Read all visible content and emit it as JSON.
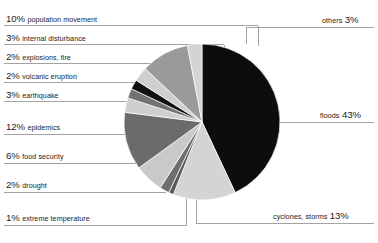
{
  "chart_data": {
    "type": "pie",
    "title": "",
    "subtitle": "",
    "xlabel": "",
    "ylabel": "",
    "legend_position": "callout-labels",
    "grid": false,
    "units": "percent",
    "total": 100,
    "categories": [
      "floods",
      "cyclones, storms",
      "extreme temperature",
      "drought",
      "food security",
      "epidemics",
      "earthquake",
      "volcanic eruption",
      "explosions, fire",
      "internal disturbance",
      "population movement",
      "others"
    ],
    "values": [
      43,
      13,
      1,
      2,
      6,
      12,
      3,
      2,
      2,
      3,
      10,
      3
    ],
    "slices": [
      {
        "label": "floods",
        "value": 43,
        "value_text": "43%",
        "color": "#0d0d0d",
        "side": "right"
      },
      {
        "label": "cyclones, storms",
        "value": 13,
        "value_text": "13%",
        "color": "#d4d4d4",
        "side": "right"
      },
      {
        "label": "extreme temperature",
        "value": 1,
        "value_text": "1%",
        "color": "#5a5a5a",
        "side": "left"
      },
      {
        "label": "drought",
        "value": 2,
        "value_text": "2%",
        "color": "#6e6e6e",
        "side": "left"
      },
      {
        "label": "food security",
        "value": 6,
        "value_text": "6%",
        "color": "#c9c9c9",
        "side": "left"
      },
      {
        "label": "epidemics",
        "value": 12,
        "value_text": "12%",
        "color": "#6b6b6b",
        "side": "left"
      },
      {
        "label": "earthquake",
        "value": 3,
        "value_text": "3%",
        "color": "#cfcfcf",
        "side": "left"
      },
      {
        "label": "volcanic eruption",
        "value": 2,
        "value_text": "2%",
        "color": "#727272",
        "side": "left"
      },
      {
        "label": "explosions, fire",
        "value": 2,
        "value_text": "2%",
        "color": "#111111",
        "side": "left"
      },
      {
        "label": "internal disturbance",
        "value": 3,
        "value_text": "3%",
        "color": "#cfcfcf",
        "side": "left"
      },
      {
        "label": "population movement",
        "value": 10,
        "value_text": "10%",
        "color": "#9a9a9a",
        "side": "left"
      },
      {
        "label": "others",
        "value": 3,
        "value_text": "3%",
        "color": "#d4d4d4",
        "side": "right"
      }
    ]
  },
  "callouts": {
    "left": [
      {
        "pct": "10%",
        "name": "population movement"
      },
      {
        "pct": "3%",
        "name": "internal disturbance"
      },
      {
        "pct": "2%",
        "name": "explosions, fire"
      },
      {
        "pct": "2%",
        "name": "volcanic eruption"
      },
      {
        "pct": "3%",
        "name": "earthquake"
      },
      {
        "pct": "12%",
        "name": "epidemics"
      },
      {
        "pct": "6%",
        "name": "food security"
      },
      {
        "pct": "2%",
        "name": "drought"
      },
      {
        "pct": "1%",
        "name": "extreme temperature"
      }
    ],
    "right": [
      {
        "name": "others",
        "pct": "3%"
      },
      {
        "name": "floods",
        "pct": "43%"
      },
      {
        "name": "cyclones, storms",
        "pct": "13%"
      }
    ]
  },
  "colors": {
    "background": "#ffffff",
    "text": "#1c1c1c",
    "leader_line": "#8c8c8c",
    "slice_edge": "#ffffff"
  }
}
